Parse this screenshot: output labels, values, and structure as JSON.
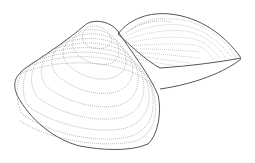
{
  "image": {
    "subject": "clam shell line drawing",
    "description": "Stippled pen illustration of a bivalve shell with two valves; the left valve is shown from the outside with concentric growth rings, the right valve opens behind it.",
    "colors": {
      "background": "#ffffff",
      "outline": "#555555",
      "stipple": "#888888"
    }
  }
}
